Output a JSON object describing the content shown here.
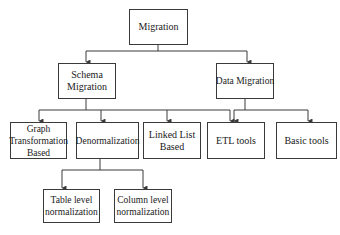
{
  "diagram": {
    "type": "hierarchy",
    "root": {
      "id": "migration",
      "label": "Migration"
    },
    "nodes": [
      {
        "id": "migration",
        "label": "Migration",
        "parent": null
      },
      {
        "id": "schema",
        "label": "Schema Migration",
        "parent": "migration"
      },
      {
        "id": "data",
        "label": "Data Migration",
        "parent": "migration"
      },
      {
        "id": "graph",
        "label": "Graph Transformation Based",
        "parent": "schema"
      },
      {
        "id": "denorm",
        "label": "Denormalization",
        "parent": "schema"
      },
      {
        "id": "linked",
        "label": "Linked List Based",
        "parent": "schema"
      },
      {
        "id": "etl",
        "label": "ETL tools",
        "parent": [
          "schema",
          "data"
        ]
      },
      {
        "id": "basic",
        "label": "Basic tools",
        "parent": "data"
      },
      {
        "id": "table",
        "label": "Table level normalization",
        "parent": "denorm"
      },
      {
        "id": "column",
        "label": "Column level normalization",
        "parent": "denorm"
      }
    ],
    "colors": {
      "line": "#3a3a3a",
      "box_border": "#3a3a3a",
      "background": "#ffffff",
      "text": "#1a1a1a"
    }
  }
}
